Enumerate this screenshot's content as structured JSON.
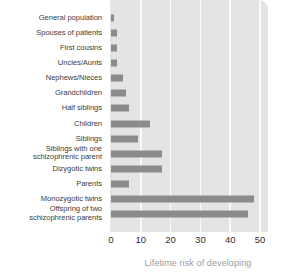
{
  "chart_data": {
    "type": "bar",
    "orientation": "horizontal",
    "title": "",
    "subtitle": "",
    "xlabel": "Lifetime risk of developing",
    "ylabel": "",
    "xlim": [
      0,
      50
    ],
    "xticks": [
      0,
      10,
      20,
      30,
      40,
      50
    ],
    "xtick_labels": [
      "0",
      "10",
      "20",
      "30",
      "40",
      "50"
    ],
    "grid": "vertical-only",
    "legend": "none",
    "bar_color": "#8b8b8b",
    "plot_background": "#e4e4e4",
    "gridline_color": "#fafafa",
    "categories": [
      "General population",
      "Spouses of patients",
      "First cousins",
      "Uncles/Aunts",
      "Nephews/Nieces",
      "Grandchildren",
      "Half siblings",
      "Children",
      "Siblings",
      "Siblings with one\nschizophrenic parent",
      "Dizygotic twins",
      "Parents",
      "Monozygotic twins",
      "Offspring of two\nschizophrenic parents"
    ],
    "values": [
      1,
      2,
      2,
      2,
      4,
      5,
      6,
      13,
      9,
      17,
      17,
      6,
      48,
      46
    ]
  },
  "axis": {
    "x_title": "Lifetime risk of developing"
  }
}
